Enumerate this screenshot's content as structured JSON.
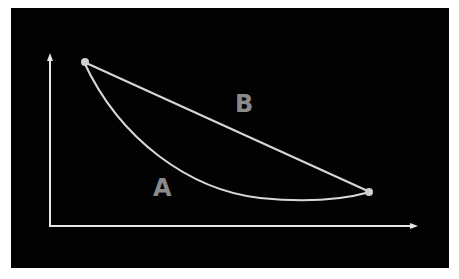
{
  "diagram": {
    "background": "#020202",
    "line_color": "#d8d8d8",
    "label_color": "#8a8a8a",
    "axes": {
      "x_axis": "horizontal arrow",
      "y_axis": "vertical arrow"
    },
    "points": [
      {
        "name": "start-point",
        "x": 84,
        "y": 62
      },
      {
        "name": "end-point",
        "x": 370,
        "y": 192
      }
    ],
    "paths": [
      {
        "label": "A",
        "type": "curve (convex, sagging below straight line)"
      },
      {
        "label": "B",
        "type": "straight line"
      }
    ],
    "labels": {
      "a": "A",
      "b": "B"
    }
  }
}
